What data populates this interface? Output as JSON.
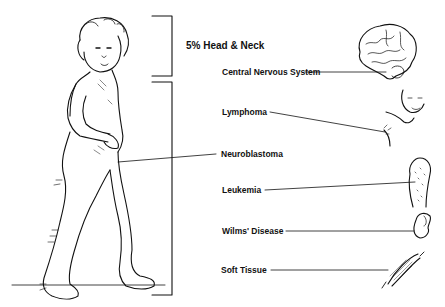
{
  "diagram": {
    "title_label": "5% Head & Neck",
    "labels": [
      {
        "id": "cns",
        "text": "Central Nervous System",
        "icon": "brain-icon"
      },
      {
        "id": "lymphoma",
        "text": "Lymphoma",
        "icon": "neck-lymph-node-icon"
      },
      {
        "id": "neuroblastoma",
        "text": "Neuroblastoma",
        "icon": "child-abdomen"
      },
      {
        "id": "leukemia",
        "text": "Leukemia",
        "icon": "bone-marrow-icon"
      },
      {
        "id": "wilms",
        "text": "Wilms' Disease",
        "icon": "kidney-icon"
      },
      {
        "id": "soft_tissue",
        "text": "Soft Tissue",
        "icon": "muscle-icon"
      }
    ],
    "figure": "walking-toddler-illustration",
    "colors": {
      "ink": "#111111",
      "background": "#ffffff"
    }
  }
}
